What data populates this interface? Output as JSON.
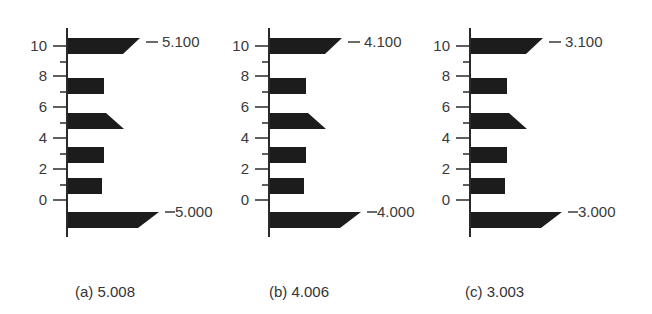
{
  "figure": {
    "colors": {
      "bar": "#1c1c1c",
      "axis": "#2a2a2a",
      "text": "#3a3a3a"
    },
    "y_ticks": [
      "0",
      "2",
      "4",
      "6",
      "8",
      "10"
    ],
    "panels": [
      {
        "id": "a",
        "caption": "(a) 5.008",
        "top_value_label": "5.100",
        "bottom_value_label": "5.000",
        "axis_x": 67,
        "caption_x": 75
      },
      {
        "id": "b",
        "caption": "(b) 4.006",
        "top_value_label": "4.100",
        "bottom_value_label": "4.000",
        "axis_x": 269,
        "caption_x": 269
      },
      {
        "id": "c",
        "caption": "(c) 3.003",
        "top_value_label": "3.100",
        "bottom_value_label": "3.000",
        "axis_x": 470,
        "caption_x": 465
      }
    ],
    "bars": [
      {
        "name": "top-pointer-bar",
        "y": 38,
        "h": 16,
        "shape": "pointer-down",
        "len_top": 72,
        "len_bot": 55
      },
      {
        "name": "bar-8",
        "y": 78,
        "h": 16,
        "shape": "rect",
        "len_top": 36,
        "len_bot": 36
      },
      {
        "name": "notch-bar-6",
        "y": 113,
        "h": 16,
        "shape": "pointer-up",
        "len_top": 38,
        "len_bot": 56
      },
      {
        "name": "bar-4",
        "y": 147,
        "h": 16,
        "shape": "rect",
        "len_top": 36,
        "len_bot": 36
      },
      {
        "name": "bar-2",
        "y": 178,
        "h": 16,
        "shape": "rect",
        "len_top": 34,
        "len_bot": 34
      },
      {
        "name": "bottom-pointer-bar",
        "y": 212,
        "h": 16,
        "shape": "pointer-down",
        "len_top": 91,
        "len_bot": 70
      }
    ]
  },
  "chart_data": {
    "type": "bar",
    "title": "",
    "xlabel": "",
    "ylabel": "",
    "y_tick_labels": [
      "0",
      "2",
      "4",
      "6",
      "8",
      "10"
    ],
    "ylim": [
      -1,
      11
    ],
    "panels": [
      {
        "caption": "(a) 5.008",
        "annotations": [
          "5.100",
          "5.000"
        ]
      },
      {
        "caption": "(b) 4.006",
        "annotations": [
          "4.100",
          "4.000"
        ]
      },
      {
        "caption": "(c) 3.003",
        "annotations": [
          "3.100",
          "3.000"
        ]
      }
    ]
  }
}
